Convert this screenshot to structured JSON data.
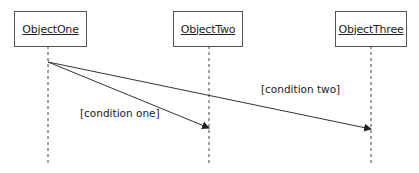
{
  "diagram": {
    "type": "sequence",
    "objects": [
      {
        "name": "ObjectOne"
      },
      {
        "name": "ObjectTwo"
      },
      {
        "name": "ObjectThree"
      }
    ],
    "messages": [
      {
        "from": "ObjectOne",
        "to": "ObjectTwo",
        "guard": "[condition one]"
      },
      {
        "from": "ObjectOne",
        "to": "ObjectThree",
        "guard": "[condition two]"
      }
    ]
  }
}
